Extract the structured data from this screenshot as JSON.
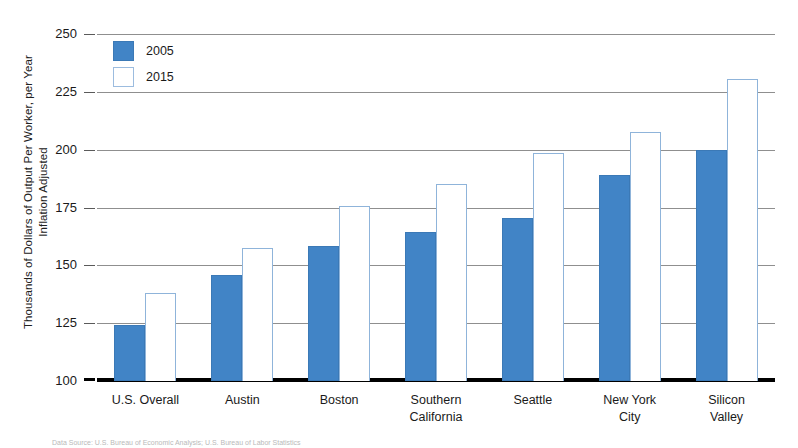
{
  "chart_data": {
    "type": "bar",
    "title": "",
    "xlabel": "",
    "ylabel": "Thousands of Dollars of Output Per Worker, per Year Inflation Adjusted",
    "ylabel_lines": [
      "Thousands of Dollars of Output Per Worker, per Year",
      "Inflation Adjusted"
    ],
    "categories": [
      "U.S. Overall",
      "Austin",
      "Boston",
      "Southern California",
      "Seattle",
      "New York City",
      "Silicon Valley"
    ],
    "category_lines": [
      [
        "U.S. Overall"
      ],
      [
        "Austin"
      ],
      [
        "Boston"
      ],
      [
        "Southern",
        "California"
      ],
      [
        "Seattle"
      ],
      [
        "New York",
        "City"
      ],
      [
        "Silicon",
        "Valley"
      ]
    ],
    "series": [
      {
        "name": "2005",
        "color": "#4184c6",
        "values": [
          124,
          146,
          158.5,
          164.5,
          170.5,
          189,
          200
        ]
      },
      {
        "name": "2015",
        "color": "#ffffff",
        "values": [
          138,
          157.5,
          175.5,
          185,
          198.5,
          207.5,
          230.5
        ]
      }
    ],
    "ylim": [
      100,
      250
    ],
    "yticks": [
      100,
      125,
      150,
      175,
      200,
      225,
      250
    ],
    "ytick_labels": [
      "100",
      "125",
      "150",
      "175",
      "200",
      "225",
      "250"
    ],
    "grid": true,
    "legend_position": "top-left",
    "legend_entries": [
      "2005",
      "2015"
    ]
  },
  "legend": {
    "entries": [
      {
        "label": "2005",
        "swatch": "filled-blue-swatch"
      },
      {
        "label": "2015",
        "swatch": "open-white-swatch"
      }
    ]
  },
  "axes": {
    "y_title_line1": "Thousands of Dollars of Output Per Worker, per Year",
    "y_title_line2": "Inflation Adjusted",
    "y_ticks": [
      "250",
      "225",
      "200",
      "175",
      "150",
      "125",
      "100"
    ]
  },
  "source": {
    "note": "Data Source: U.S. Bureau of Economic Analysis; U.S. Bureau of Labor Statistics"
  }
}
